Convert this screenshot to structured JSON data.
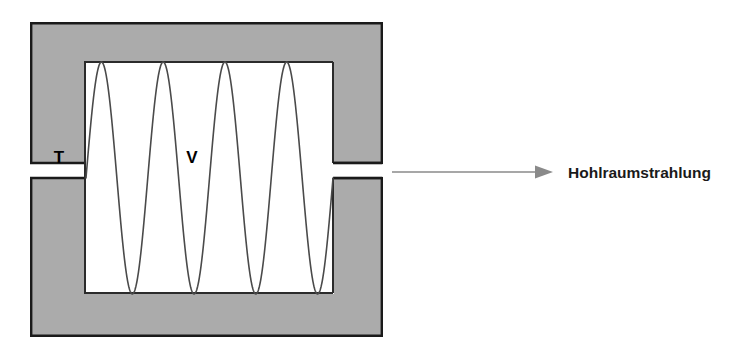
{
  "figure": {
    "type": "physics-schematic",
    "background_color": "#ffffff"
  },
  "cavity": {
    "wall": {
      "name": "cavity-wall",
      "fill_color": "#ababab",
      "stroke_color": "#1a1a1a",
      "stroke_width": 2.4,
      "x": 30,
      "y": 22,
      "width": 353,
      "height": 315
    },
    "interior": {
      "name": "cavity-interior",
      "fill_color": "#ffffff",
      "stroke_color": "#2b2b2b",
      "stroke_width": 2.0,
      "x": 84,
      "y": 62,
      "width": 250,
      "height": 232
    },
    "aperture": {
      "name": "cavity-aperture-slit",
      "y_top": 163,
      "y_bottom": 178,
      "x_start": 334,
      "x_end": 384
    },
    "labels": {
      "temperature": {
        "text": "T",
        "x": 59,
        "y": 158
      },
      "volume": {
        "text": "V",
        "x": 192,
        "y": 158
      }
    }
  },
  "standing_wave": {
    "name": "standing-wave",
    "stroke_color": "#4a4a4a",
    "stroke_width": 1.6,
    "periods": 4,
    "x_start": 86,
    "x_end": 333,
    "y_center": 178,
    "amplitude": 116,
    "phase_note": "starts at center rising, ends at center rising"
  },
  "emission": {
    "arrow": {
      "name": "radiation-arrow",
      "color": "#8a8a8a",
      "x_start": 392,
      "x_end": 553,
      "y": 172,
      "line_width": 1.6,
      "head_length": 17,
      "head_width": 13
    },
    "caption": {
      "text": "Hohlraumstrahlung",
      "x": 568,
      "y": 173
    }
  }
}
